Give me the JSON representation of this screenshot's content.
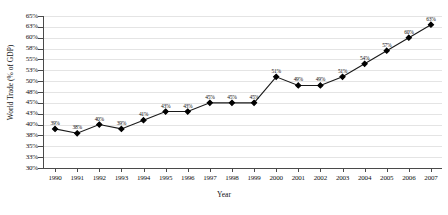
{
  "chart_data": {
    "type": "line",
    "title": "",
    "xlabel": "Year",
    "ylabel": "World Trade (% of GDP)",
    "ylim": [
      30,
      65
    ],
    "grid": true,
    "legend": "none",
    "marker": "diamond",
    "line_color": "#1a1a1a",
    "marker_color": "#000000",
    "grid_color": "#e4e4e4",
    "data_labels": true,
    "categories": [
      "1990",
      "1991",
      "1992",
      "1993",
      "1994",
      "1995",
      "1996",
      "1997",
      "1998",
      "1999",
      "2000",
      "2001",
      "2002",
      "2003",
      "2004",
      "2005",
      "2006",
      "2007"
    ],
    "values": [
      39,
      38,
      40,
      39,
      41,
      43,
      43,
      45,
      45,
      45,
      51,
      49,
      49,
      51,
      54,
      57,
      60,
      63
    ],
    "point_labels": [
      "39%",
      "38%",
      "40%",
      "39%",
      "41%",
      "43%",
      "43%",
      "45%",
      "45%",
      "45%",
      "51%",
      "49%",
      "49%",
      "51%",
      "54%",
      "57%",
      "60%",
      "63%"
    ],
    "ytick_labels": [
      "30%",
      "33%",
      "35%",
      "38%",
      "40%",
      "43%",
      "45%",
      "48%",
      "50%",
      "53%",
      "55%",
      "58%",
      "60%",
      "63%",
      "65%"
    ],
    "ytick_values": [
      30,
      32.5,
      35,
      37.5,
      40,
      42.5,
      45,
      47.5,
      50,
      52.5,
      55,
      57.5,
      60,
      62.5,
      65
    ]
  }
}
